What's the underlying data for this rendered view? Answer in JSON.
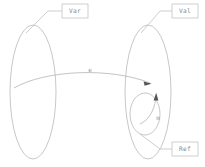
{
  "diagram": {
    "background_color": "#ffffff",
    "stroke_color": "#b9b9bd",
    "text_color": "#8a8a90",
    "arrow_color": "#55555a",
    "nodes": [
      {
        "id": "var",
        "label": "Var",
        "shape": "ellipse",
        "cx": 33,
        "cy": 92,
        "rx": 23,
        "ry": 67
      },
      {
        "id": "val",
        "label": "Val",
        "shape": "ellipse",
        "cx": 148,
        "cy": 92,
        "rx": 23,
        "ry": 67
      },
      {
        "id": "ref",
        "label": "Ref",
        "shape": "ellipse",
        "cx": 145,
        "cy": 114,
        "rx": 15,
        "ry": 21
      }
    ],
    "edges": [
      {
        "id": "edge-e",
        "label": "e",
        "from": "var",
        "to": "val",
        "label_x": 90,
        "label_y": 70
      },
      {
        "id": "edge-m",
        "label": "m",
        "from": "ref",
        "to": "val",
        "label_x": 158,
        "label_y": 118
      }
    ],
    "label_boxes": [
      {
        "id": "label-box-var",
        "text": "Var",
        "x": 62,
        "y": 4,
        "width": 26,
        "height": 14
      },
      {
        "id": "label-box-val",
        "text": "Val",
        "x": 172,
        "y": 4,
        "width": 26,
        "height": 14
      },
      {
        "id": "label-box-ref",
        "text": "Ref",
        "x": 172,
        "y": 142,
        "width": 26,
        "height": 14
      }
    ]
  }
}
